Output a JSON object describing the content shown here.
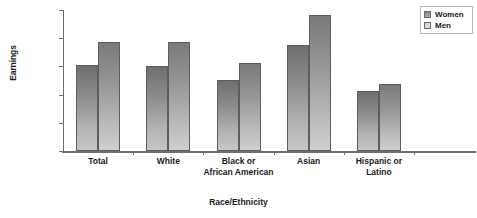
{
  "chart_data": {
    "type": "bar",
    "title": "",
    "xlabel": "Race/Ethnicity",
    "ylabel": "Earnings",
    "categories": [
      "Total",
      "White",
      "Black or African American",
      "Asian",
      "Hispanic or Latino"
    ],
    "category_lines": [
      [
        "Total"
      ],
      [
        "White"
      ],
      [
        "Black or",
        "African American"
      ],
      [
        "Asian"
      ],
      [
        "Hispanic or",
        "Latino"
      ]
    ],
    "series": [
      {
        "name": "Women",
        "values": [
          608,
          605,
          505,
          753,
          426
        ]
      },
      {
        "name": "Men",
        "values": [
          772,
          770,
          621,
          963,
          477
        ]
      }
    ],
    "ylim": [
      0,
      1000
    ],
    "yticks": [
      0,
      200,
      400,
      600,
      800,
      1000
    ],
    "ytick_labels": [
      "$0",
      "$200",
      "$400",
      "$600",
      "$800",
      "$1,000"
    ],
    "grid": false,
    "legend_position": "top-right",
    "colors": {
      "women": "#8b8b8b",
      "men": "#bcbcbc",
      "axis": "#6e6e6e",
      "text": "#1a1a1a",
      "background": "#ffffff"
    }
  },
  "legend": {
    "items": [
      {
        "label": "Women",
        "key": "women"
      },
      {
        "label": "Men",
        "key": "men"
      }
    ]
  }
}
